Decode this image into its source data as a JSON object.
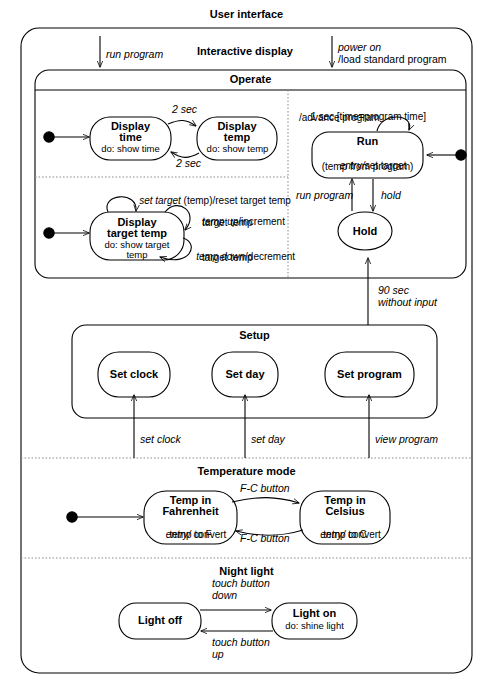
{
  "diagram": {
    "type": "uml-state-machine",
    "title": "User interface",
    "stroke_color": "#000000",
    "background_color": "#ffffff",
    "dashed_color": "#9a9a9a"
  },
  "regions": {
    "user_interface": {
      "label": "User interface"
    },
    "interactive_display": {
      "label": "Interactive display"
    },
    "operate": {
      "label": "Operate"
    },
    "setup": {
      "label": "Setup"
    },
    "temperature_mode": {
      "label": "Temperature mode"
    },
    "night_light": {
      "label": "Night light"
    }
  },
  "states": {
    "display_time": {
      "name": "Display\ntime",
      "name_line1": "Display",
      "name_line2": "time",
      "activity": "do: show time"
    },
    "display_temp": {
      "name_line1": "Display",
      "name_line2": "temp",
      "activity": "do: show temp"
    },
    "display_target_temp": {
      "name_line1": "Display",
      "name_line2": "target temp",
      "activity_line1": "do: show target",
      "activity_line2": "temp"
    },
    "run": {
      "name": "Run",
      "entry_keyword": "entry/",
      "entry_rest": "set target",
      "entry_line2": "(temp from program)"
    },
    "hold": {
      "name": "Hold"
    },
    "set_clock": {
      "name": "Set clock"
    },
    "set_day": {
      "name": "Set day"
    },
    "set_program": {
      "name": "Set program"
    },
    "temp_in_fahrenheit": {
      "name_line1": "Temp in",
      "name_line2": "Fahrenheit",
      "entry_keyword": "entry/",
      "entry_rest": " convert",
      "entry_line2": "temp to F"
    },
    "temp_in_celsius": {
      "name_line1": "Temp in",
      "name_line2": "Celsius",
      "entry_keyword": "entry/",
      "entry_rest": " convert",
      "entry_line2": "temp to C"
    },
    "light_off": {
      "name": "Light off"
    },
    "light_on": {
      "name": "Light on",
      "activity": "do: shine light"
    }
  },
  "transitions": {
    "run_program_top": {
      "label": "run program"
    },
    "power_on": {
      "label_line1": "power on",
      "label_line2": "/load standard program"
    },
    "time_to_temp": {
      "label": "2 sec"
    },
    "temp_to_time": {
      "label": "2 sec"
    },
    "run_self": {
      "label_line1": "1 sec [time=program time]",
      "label_line2": "/advance program",
      "event": "1 sec",
      "guard": " [time=program time]",
      "action": "/advance program"
    },
    "run_to_hold": {
      "label": "hold"
    },
    "hold_to_run": {
      "label": "run program"
    },
    "set_target": {
      "event": "set target",
      "rest": " (temp)/reset target temp"
    },
    "temp_up": {
      "event": "temp up",
      "rest": "/increment",
      "line2": "target temp"
    },
    "temp_down": {
      "event": "temp down",
      "rest": "/decrement",
      "line2": "target temp"
    },
    "ninety_sec": {
      "label_line1": "90 sec",
      "label_line2": "without input"
    },
    "set_clock_tr": {
      "label": "set clock"
    },
    "set_day_tr": {
      "label": "set day"
    },
    "view_program_tr": {
      "label": "view program"
    },
    "f_to_c": {
      "label": "F-C button"
    },
    "c_to_f": {
      "label": "F-C button"
    },
    "touch_down": {
      "label_line1": "touch button",
      "label_line2": "down"
    },
    "touch_up": {
      "label_line1": "touch button",
      "label_line2": "up"
    }
  },
  "initial_states": [
    {
      "name": "initial-display-time"
    },
    {
      "name": "initial-display-target-temp"
    },
    {
      "name": "initial-run"
    },
    {
      "name": "initial-temp-fahrenheit"
    }
  ]
}
